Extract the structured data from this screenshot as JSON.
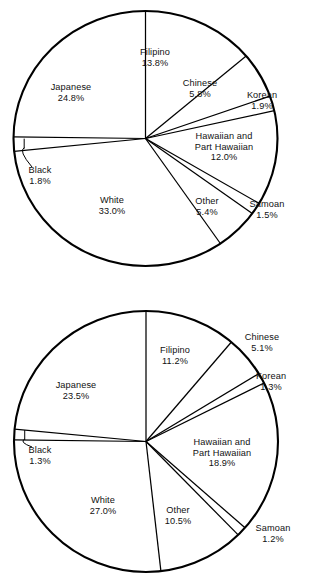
{
  "figure": {
    "background_color": "#ffffff",
    "line_color": "#000000",
    "chart_count": 2
  },
  "chart_data": [
    {
      "type": "pie",
      "title": "",
      "subtitle": "",
      "xlabel": "",
      "ylabel": "",
      "legend": "none",
      "grid": false,
      "start_angle_deg": 90,
      "direction": "clockwise",
      "categories": [
        "Filipino",
        "Chinese",
        "Korean",
        "Hawaiian and Part Hawaiian",
        "Samoan",
        "Other",
        "White",
        "Black",
        "Japanese"
      ],
      "values": [
        13.8,
        5.8,
        1.9,
        12.0,
        1.5,
        5.4,
        33.0,
        1.8,
        24.8
      ],
      "value_labels": [
        "13.8%",
        "5.8%",
        "1.9%",
        "12.0%",
        "1.5%",
        "5.4%",
        "33.0%",
        "1.8%",
        "24.8%"
      ],
      "total": 100.0,
      "slices": [
        {
          "name": "Filipino",
          "name_lines": [
            "Filipino"
          ],
          "value": 13.8,
          "value_label": "13.8%",
          "leader": false
        },
        {
          "name": "Chinese",
          "name_lines": [
            "Chinese"
          ],
          "value": 5.8,
          "value_label": "5.8%",
          "leader": false
        },
        {
          "name": "Korean",
          "name_lines": [
            "Korean"
          ],
          "value": 1.9,
          "value_label": "1.9%",
          "leader": false
        },
        {
          "name": "Hawaiian and Part Hawaiian",
          "name_lines": [
            "Hawaiian and",
            "Part Hawaiian"
          ],
          "value": 12.0,
          "value_label": "12.0%",
          "leader": false
        },
        {
          "name": "Samoan",
          "name_lines": [
            "Samoan"
          ],
          "value": 1.5,
          "value_label": "1.5%",
          "leader": false
        },
        {
          "name": "Other",
          "name_lines": [
            "Other"
          ],
          "value": 5.4,
          "value_label": "5.4%",
          "leader": false
        },
        {
          "name": "White",
          "name_lines": [
            "White"
          ],
          "value": 33.0,
          "value_label": "33.0%",
          "leader": false
        },
        {
          "name": "Black",
          "name_lines": [
            "Black"
          ],
          "value": 1.8,
          "value_label": "1.8%",
          "leader": true
        },
        {
          "name": "Japanese",
          "name_lines": [
            "Japanese"
          ],
          "value": 24.8,
          "value_label": "24.8%",
          "leader": false
        }
      ]
    },
    {
      "type": "pie",
      "title": "",
      "subtitle": "",
      "xlabel": "",
      "ylabel": "",
      "legend": "none",
      "grid": false,
      "start_angle_deg": 90,
      "direction": "clockwise",
      "categories": [
        "Filipino",
        "Chinese",
        "Korean",
        "Hawaiian and Part Hawaiian",
        "Samoan",
        "Other",
        "White",
        "Black",
        "Japanese"
      ],
      "values": [
        11.2,
        5.1,
        1.3,
        18.9,
        1.2,
        10.5,
        27.0,
        1.3,
        23.5
      ],
      "value_labels": [
        "11.2%",
        "5.1%",
        "1.3%",
        "18.9%",
        "1.2%",
        "10.5%",
        "27.0%",
        "1.3%",
        "23.5%"
      ],
      "total": 100.0,
      "slices": [
        {
          "name": "Filipino",
          "name_lines": [
            "Filipino"
          ],
          "value": 11.2,
          "value_label": "11.2%",
          "leader": false
        },
        {
          "name": "Chinese",
          "name_lines": [
            "Chinese"
          ],
          "value": 5.1,
          "value_label": "5.1%",
          "leader": false
        },
        {
          "name": "Korean",
          "name_lines": [
            "Korean"
          ],
          "value": 1.3,
          "value_label": "1.3%",
          "leader": false
        },
        {
          "name": "Hawaiian and Part Hawaiian",
          "name_lines": [
            "Hawaiian and",
            "Part Hawaiian"
          ],
          "value": 18.9,
          "value_label": "18.9%",
          "leader": false
        },
        {
          "name": "Samoan",
          "name_lines": [
            "Samoan"
          ],
          "value": 1.2,
          "value_label": "1.2%",
          "leader": false
        },
        {
          "name": "Other",
          "name_lines": [
            "Other"
          ],
          "value": 10.5,
          "value_label": "10.5%",
          "leader": false
        },
        {
          "name": "White",
          "name_lines": [
            "White"
          ],
          "value": 27.0,
          "value_label": "27.0%",
          "leader": false
        },
        {
          "name": "Black",
          "name_lines": [
            "Black"
          ],
          "value": 1.3,
          "value_label": "1.3%",
          "leader": true
        },
        {
          "name": "Japanese",
          "name_lines": [
            "Japanese"
          ],
          "value": 23.5,
          "value_label": "23.5%",
          "leader": false
        }
      ]
    }
  ],
  "geometry": [
    {
      "center_x": 145.5,
      "center_y": 138.5,
      "radius_x": 132.0,
      "radius_y": 127.5,
      "label_positions": [
        {
          "x": 155,
          "y": 47,
          "align": "center"
        },
        {
          "x": 200,
          "y": 78,
          "align": "center"
        },
        {
          "x": 262,
          "y": 90,
          "align": "center"
        },
        {
          "x": 224,
          "y": 131,
          "align": "center"
        },
        {
          "x": 267,
          "y": 199,
          "align": "center"
        },
        {
          "x": 207,
          "y": 196,
          "align": "center"
        },
        {
          "x": 112,
          "y": 195,
          "align": "center"
        },
        {
          "x": 40,
          "y": 165,
          "align": "center"
        },
        {
          "x": 71,
          "y": 82,
          "align": "center"
        }
      ]
    },
    {
      "center_x": 146.0,
      "center_y": 441.5,
      "radius_x": 132.0,
      "radius_y": 130.5,
      "label_positions": [
        {
          "x": 175,
          "y": 345,
          "align": "center"
        },
        {
          "x": 262,
          "y": 332,
          "align": "center"
        },
        {
          "x": 271,
          "y": 371,
          "align": "center"
        },
        {
          "x": 222,
          "y": 437,
          "align": "center"
        },
        {
          "x": 273,
          "y": 523,
          "align": "center"
        },
        {
          "x": 178,
          "y": 505,
          "align": "center"
        },
        {
          "x": 103,
          "y": 495,
          "align": "center"
        },
        {
          "x": 40,
          "y": 445,
          "align": "center"
        },
        {
          "x": 76,
          "y": 380,
          "align": "center"
        }
      ]
    }
  ]
}
